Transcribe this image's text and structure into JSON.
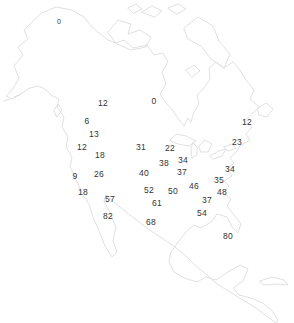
{
  "map": {
    "region_name": "North America",
    "outline_color": "#dcdcdc",
    "background_color": "#ffffff",
    "label_color": "#333333"
  },
  "chart_data": {
    "type": "scatter",
    "title": "",
    "points": [
      {
        "value": "0",
        "x": 59,
        "y": 21,
        "small": true
      },
      {
        "value": "12",
        "x": 103,
        "y": 103
      },
      {
        "value": "0",
        "x": 154,
        "y": 101
      },
      {
        "value": "6",
        "x": 87,
        "y": 121
      },
      {
        "value": "12",
        "x": 247,
        "y": 122
      },
      {
        "value": "13",
        "x": 94,
        "y": 134
      },
      {
        "value": "23",
        "x": 237,
        "y": 142
      },
      {
        "value": "12",
        "x": 82,
        "y": 147
      },
      {
        "value": "31",
        "x": 141,
        "y": 147
      },
      {
        "value": "22",
        "x": 170,
        "y": 148
      },
      {
        "value": "18",
        "x": 100,
        "y": 155
      },
      {
        "value": "34",
        "x": 183,
        "y": 160
      },
      {
        "value": "38",
        "x": 164,
        "y": 163
      },
      {
        "value": "34",
        "x": 230,
        "y": 169
      },
      {
        "value": "37",
        "x": 182,
        "y": 172
      },
      {
        "value": "40",
        "x": 144,
        "y": 173
      },
      {
        "value": "26",
        "x": 99,
        "y": 174
      },
      {
        "value": "9",
        "x": 75,
        "y": 176
      },
      {
        "value": "35",
        "x": 219,
        "y": 180
      },
      {
        "value": "46",
        "x": 194,
        "y": 186
      },
      {
        "value": "52",
        "x": 149,
        "y": 190
      },
      {
        "value": "50",
        "x": 173,
        "y": 191
      },
      {
        "value": "48",
        "x": 222,
        "y": 192
      },
      {
        "value": "18",
        "x": 83,
        "y": 192
      },
      {
        "value": "57",
        "x": 110,
        "y": 199
      },
      {
        "value": "37",
        "x": 207,
        "y": 200
      },
      {
        "value": "61",
        "x": 157,
        "y": 203
      },
      {
        "value": "54",
        "x": 202,
        "y": 213
      },
      {
        "value": "82",
        "x": 108,
        "y": 216
      },
      {
        "value": "68",
        "x": 151,
        "y": 222
      },
      {
        "value": "80",
        "x": 228,
        "y": 236
      }
    ]
  }
}
